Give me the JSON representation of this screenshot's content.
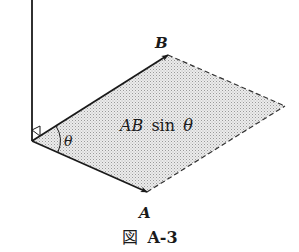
{
  "diagram": {
    "caption": "図 A-3",
    "caption_prefix": "図",
    "caption_id": "A-3",
    "labels": {
      "vector_b": "B",
      "vector_a": "A",
      "angle": "θ",
      "area_main": "AB",
      "area_func": "sin",
      "area_angle": "θ"
    },
    "points": {
      "origin": [
        32,
        141
      ],
      "b_tip": [
        168,
        55
      ],
      "a_tip": [
        147,
        192
      ],
      "far_corner": [
        285,
        106
      ],
      "axis_top": [
        32,
        0
      ]
    },
    "colors": {
      "stroke": "#1a1a1a",
      "fill": "#d9d9d9",
      "background": "#ffffff"
    }
  }
}
